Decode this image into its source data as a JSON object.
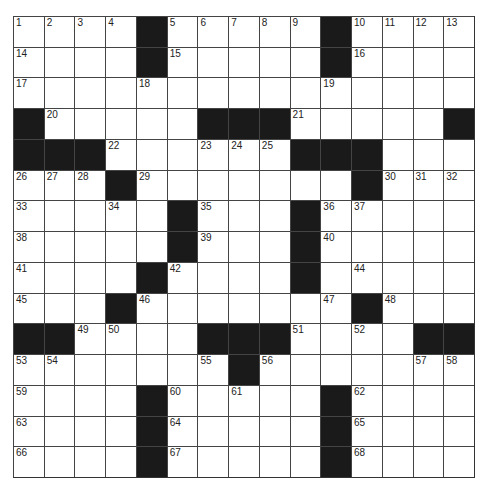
{
  "puzzle": {
    "size": 15,
    "colors": {
      "black": "#1a1a1a",
      "white": "#ffffff",
      "line": "#444444"
    },
    "rows": [
      "....#.....#....",
      "....#.....#....",
      "...............",
      "#.....###.....#",
      "###......###...",
      "...#.......#...",
      ".....#...#.....",
      ".....#...#.....",
      "....#....#.....",
      "...#.......#...",
      "##....###....##",
      ".......#.......",
      "....#.....#....",
      "....#.....#....",
      "....#.....#...."
    ],
    "numbers": [
      [
        "1",
        "2",
        "3",
        "4",
        "",
        "5",
        "6",
        "7",
        "8",
        "9",
        "",
        "10",
        "11",
        "12",
        "13"
      ],
      [
        "14",
        "",
        "",
        "",
        "",
        "15",
        "",
        "",
        "",
        "",
        "",
        "16",
        "",
        "",
        ""
      ],
      [
        "17",
        "",
        "",
        "",
        "18",
        "",
        "",
        "",
        "",
        "",
        "19",
        "",
        "",
        "",
        ""
      ],
      [
        "",
        "20",
        "",
        "",
        "",
        "",
        "",
        "",
        "",
        "21",
        "",
        "",
        "",
        "",
        ""
      ],
      [
        "",
        "",
        "",
        "22",
        "",
        "",
        "23",
        "24",
        "25",
        "",
        "",
        "",
        "",
        "",
        ""
      ],
      [
        "26",
        "27",
        "28",
        "",
        "29",
        "",
        "",
        "",
        "",
        "",
        "",
        "",
        "30",
        "31",
        "32"
      ],
      [
        "33",
        "",
        "",
        "34",
        "",
        "",
        "35",
        "",
        "",
        "",
        "36",
        "37",
        "",
        "",
        ""
      ],
      [
        "38",
        "",
        "",
        "",
        "",
        "",
        "39",
        "",
        "",
        "",
        "40",
        "",
        "",
        "",
        ""
      ],
      [
        "41",
        "",
        "",
        "",
        "",
        "42",
        "",
        "",
        "",
        "43",
        "",
        "44",
        "",
        "",
        ""
      ],
      [
        "45",
        "",
        "",
        "",
        "46",
        "",
        "",
        "",
        "",
        "",
        "47",
        "",
        "48",
        "",
        ""
      ],
      [
        "",
        "",
        "49",
        "50",
        "",
        "",
        "",
        "",
        "",
        "51",
        "",
        "52",
        "",
        "",
        ""
      ],
      [
        "53",
        "54",
        "",
        "",
        "",
        "",
        "55",
        "",
        "56",
        "",
        "",
        "",
        "",
        "57",
        "58"
      ],
      [
        "59",
        "",
        "",
        "",
        "",
        "60",
        "",
        "61",
        "",
        "",
        "",
        "62",
        "",
        "",
        ""
      ],
      [
        "63",
        "",
        "",
        "",
        "",
        "64",
        "",
        "",
        "",
        "",
        "",
        "65",
        "",
        "",
        ""
      ],
      [
        "66",
        "",
        "",
        "",
        "",
        "67",
        "",
        "",
        "",
        "",
        "",
        "68",
        "",
        "",
        ""
      ]
    ]
  }
}
